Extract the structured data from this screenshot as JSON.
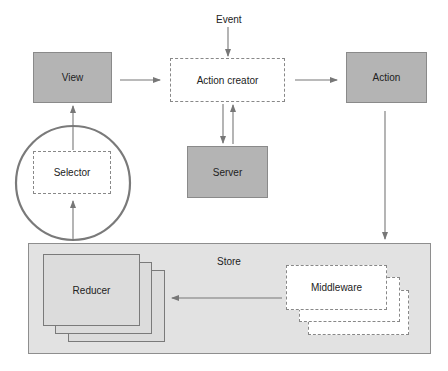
{
  "diagram": {
    "nodes": {
      "event": "Event",
      "view": "View",
      "action_creator": "Action creator",
      "action": "Action",
      "server": "Server",
      "selector": "Selector",
      "store": "Store",
      "reducer": "Reducer",
      "middleware": "Middleware"
    },
    "edges": [
      {
        "from": "Event",
        "to": "Action creator"
      },
      {
        "from": "View",
        "to": "Action creator"
      },
      {
        "from": "Action creator",
        "to": "Action"
      },
      {
        "from": "Action creator",
        "to": "Server"
      },
      {
        "from": "Server",
        "to": "Action creator"
      },
      {
        "from": "Action",
        "to": "Store"
      },
      {
        "from": "Middleware",
        "to": "Reducer"
      },
      {
        "from": "Store",
        "to": "Selector"
      },
      {
        "from": "Selector",
        "to": "View"
      }
    ],
    "colors": {
      "solid_box": "#b4b4b4",
      "store_bg": "#e2e2e2",
      "line": "#777777",
      "circle": "#7a7a7a"
    }
  }
}
